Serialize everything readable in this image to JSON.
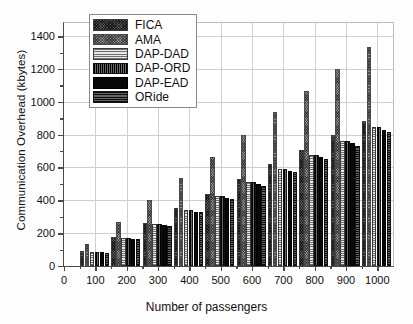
{
  "chart_data": {
    "type": "bar",
    "title": "",
    "xlabel": "Number of passengers",
    "ylabel": "Communication Overhead (kbytes)",
    "categories": [
      "100",
      "200",
      "300",
      "400",
      "500",
      "600",
      "700",
      "800",
      "900",
      "1000"
    ],
    "xlim": [
      0,
      1050
    ],
    "xticks": [
      0,
      100,
      200,
      300,
      400,
      500,
      600,
      700,
      800,
      900,
      1000
    ],
    "ylim": [
      0,
      1480
    ],
    "yticks": [
      0,
      200,
      400,
      600,
      800,
      1000,
      1200,
      1400
    ],
    "grid": true,
    "legend_position": "top-left-inside",
    "series": [
      {
        "name": "FICA",
        "pattern": "crosshatch-dark",
        "color": "#5a5a5a",
        "values": [
          90,
          178,
          265,
          352,
          441,
          531,
          620,
          708,
          795,
          883
        ]
      },
      {
        "name": "AMA",
        "pattern": "crosshatch-light",
        "color": "#8f8f8f",
        "values": [
          134,
          268,
          401,
          534,
          667,
          801,
          935,
          1068,
          1201,
          1335
        ]
      },
      {
        "name": "DAP-DAD",
        "pattern": "horizontal-light",
        "color": "#d8d8d8",
        "values": [
          85,
          169,
          254,
          339,
          424,
          509,
          593,
          678,
          762,
          847
        ]
      },
      {
        "name": "DAP-ORD",
        "pattern": "vertical-dark",
        "color": "#2a2a2a",
        "values": [
          85,
          169,
          254,
          339,
          424,
          509,
          593,
          678,
          762,
          847
        ]
      },
      {
        "name": "DAP-EAD",
        "pattern": "solid-black",
        "color": "#080808",
        "values": [
          83,
          166,
          249,
          332,
          415,
          498,
          581,
          664,
          747,
          830
        ]
      },
      {
        "name": "ORide",
        "pattern": "horizontal-dark",
        "color": "#3a3a3a",
        "values": [
          82,
          163,
          245,
          326,
          408,
          489,
          571,
          652,
          734,
          815
        ]
      }
    ]
  },
  "axis": {
    "y_title": "Communication Overhead (kbytes)",
    "x_title": "Number of passengers",
    "y_tick_labels": [
      "0",
      "200",
      "400",
      "600",
      "800",
      "1000",
      "1200",
      "1400"
    ],
    "x_tick_labels": [
      "0",
      "100",
      "200",
      "300",
      "400",
      "500",
      "600",
      "700",
      "800",
      "900",
      "1000"
    ]
  },
  "legend": {
    "items": [
      {
        "label": "FICA"
      },
      {
        "label": "AMA"
      },
      {
        "label": "DAP-DAD"
      },
      {
        "label": "DAP-ORD"
      },
      {
        "label": "DAP-EAD"
      },
      {
        "label": "ORide"
      }
    ]
  }
}
